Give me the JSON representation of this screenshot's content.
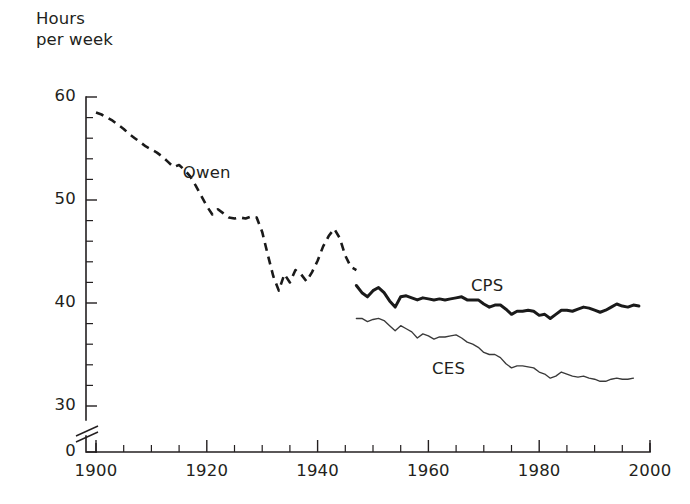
{
  "chart_data": {
    "type": "line",
    "title": "",
    "subtitle": "",
    "ylabel_line1": "Hours",
    "ylabel_line2": "per week",
    "xlabel": "",
    "xlim": [
      1900,
      2000
    ],
    "ylim": [
      30,
      60
    ],
    "y_axis_break": true,
    "y_axis_break_note": "axis broken between 0 and 30",
    "grid": false,
    "legend_position": "inline-annotations",
    "y_ticks_major": [
      30,
      40,
      50,
      60
    ],
    "y_ticks_major_labels": [
      "30",
      "40",
      "50",
      "60"
    ],
    "y_tick_zero_label": "0",
    "y_ticks_minor_step": 2,
    "x_ticks_major": [
      1900,
      1920,
      1940,
      1960,
      1980,
      2000
    ],
    "x_ticks_major_labels": [
      "1900",
      "1920",
      "1940",
      "1960",
      "1980",
      "2000"
    ],
    "x_ticks_minor_step": 5,
    "series": [
      {
        "name": "Owen",
        "label": "Owen",
        "style": "dashed",
        "color": "#1a1a1a",
        "x": [
          1900,
          1901,
          1902,
          1903,
          1904,
          1905,
          1906,
          1907,
          1908,
          1909,
          1910,
          1911,
          1912,
          1913,
          1914,
          1915,
          1916,
          1917,
          1918,
          1919,
          1920,
          1921,
          1922,
          1923,
          1924,
          1925,
          1926,
          1927,
          1928,
          1929,
          1930,
          1931,
          1932,
          1933,
          1934,
          1935,
          1936,
          1937,
          1938,
          1939,
          1940,
          1941,
          1942,
          1943,
          1944,
          1945,
          1946,
          1947
        ],
        "values": [
          58.5,
          58.3,
          58.0,
          57.7,
          57.3,
          56.9,
          56.4,
          56.0,
          55.6,
          55.2,
          54.9,
          54.6,
          54.2,
          53.7,
          53.2,
          53.4,
          52.9,
          52.3,
          51.4,
          50.4,
          49.4,
          48.6,
          49.1,
          48.7,
          48.3,
          48.2,
          48.3,
          48.2,
          48.4,
          48.3,
          46.9,
          44.7,
          42.6,
          41.2,
          42.8,
          42.0,
          43.2,
          42.8,
          42.1,
          43.0,
          44.1,
          45.5,
          46.5,
          47.2,
          46.3,
          44.6,
          43.5,
          43.2
        ]
      },
      {
        "name": "CPS",
        "label": "CPS",
        "style": "solid-thick",
        "color": "#1a1a1a",
        "x": [
          1947,
          1948,
          1949,
          1950,
          1951,
          1952,
          1953,
          1954,
          1955,
          1956,
          1957,
          1958,
          1959,
          1960,
          1961,
          1962,
          1963,
          1964,
          1965,
          1966,
          1967,
          1968,
          1969,
          1970,
          1971,
          1972,
          1973,
          1974,
          1975,
          1976,
          1977,
          1978,
          1979,
          1980,
          1981,
          1982,
          1983,
          1984,
          1985,
          1986,
          1987,
          1988,
          1989,
          1990,
          1991,
          1992,
          1993,
          1994,
          1995,
          1996,
          1997,
          1998
        ],
        "values": [
          41.7,
          41.0,
          40.6,
          41.2,
          41.5,
          41.0,
          40.2,
          39.6,
          40.6,
          40.7,
          40.5,
          40.3,
          40.5,
          40.4,
          40.3,
          40.4,
          40.3,
          40.4,
          40.5,
          40.6,
          40.3,
          40.3,
          40.3,
          39.9,
          39.6,
          39.8,
          39.8,
          39.4,
          38.9,
          39.2,
          39.2,
          39.3,
          39.2,
          38.8,
          38.9,
          38.5,
          38.9,
          39.3,
          39.3,
          39.2,
          39.4,
          39.6,
          39.5,
          39.3,
          39.1,
          39.3,
          39.6,
          39.9,
          39.7,
          39.6,
          39.8,
          39.7
        ]
      },
      {
        "name": "CES",
        "label": "CES",
        "style": "solid-thin",
        "color": "#3a3a3a",
        "x": [
          1947,
          1948,
          1949,
          1950,
          1951,
          1952,
          1953,
          1954,
          1955,
          1956,
          1957,
          1958,
          1959,
          1960,
          1961,
          1962,
          1963,
          1964,
          1965,
          1966,
          1967,
          1968,
          1969,
          1970,
          1971,
          1972,
          1973,
          1974,
          1975,
          1976,
          1977,
          1978,
          1979,
          1980,
          1981,
          1982,
          1983,
          1984,
          1985,
          1986,
          1987,
          1988,
          1989,
          1990,
          1991,
          1992,
          1993,
          1994,
          1995,
          1996,
          1997
        ],
        "values": [
          38.5,
          38.5,
          38.2,
          38.4,
          38.5,
          38.3,
          37.8,
          37.3,
          37.8,
          37.5,
          37.2,
          36.6,
          37.0,
          36.8,
          36.5,
          36.7,
          36.7,
          36.8,
          36.9,
          36.6,
          36.2,
          36.0,
          35.7,
          35.2,
          35.0,
          35.0,
          34.7,
          34.1,
          33.7,
          33.9,
          33.9,
          33.8,
          33.7,
          33.3,
          33.1,
          32.7,
          32.9,
          33.3,
          33.1,
          32.9,
          32.8,
          32.9,
          32.7,
          32.6,
          32.4,
          32.4,
          32.6,
          32.7,
          32.6,
          32.6,
          32.7
        ]
      }
    ],
    "annotations": [
      {
        "text": "Owen",
        "x": 1920,
        "y": 52.5
      },
      {
        "text": "CPS",
        "x": 1972,
        "y": 41.6
      },
      {
        "text": "CES",
        "x": 1965,
        "y": 33.5
      }
    ]
  }
}
